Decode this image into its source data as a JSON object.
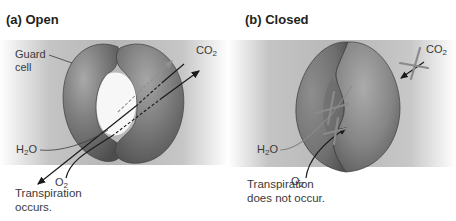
{
  "figure": {
    "colors": {
      "background_band": "#b9b9b9",
      "guard_cell": "#7a7a7a",
      "guard_cell_highlight": "#a8a8a8",
      "guard_cell_shadow": "#4e4e4e",
      "arrow": "#1a1a1a",
      "blocked_arrow": "#8a8a8a"
    }
  },
  "panels": [
    {
      "id": "a",
      "title": "(a) Open",
      "labels": {
        "guard_cell": [
          "Guard",
          "cell"
        ],
        "co2": {
          "base": "CO",
          "sub": "2"
        },
        "h2o": {
          "pre": "H",
          "sub": "2",
          "post": "O"
        },
        "o2": {
          "base": "O",
          "sub": "2"
        }
      },
      "caption": [
        "Transpiration",
        "occurs."
      ]
    },
    {
      "id": "b",
      "title": "(b) Closed",
      "labels": {
        "co2": {
          "base": "CO",
          "sub": "2"
        },
        "h2o": {
          "pre": "H",
          "sub": "2",
          "post": "O"
        },
        "o2": {
          "base": "O",
          "sub": "2"
        }
      },
      "caption": [
        "Transpiration",
        "does not occur."
      ]
    }
  ]
}
